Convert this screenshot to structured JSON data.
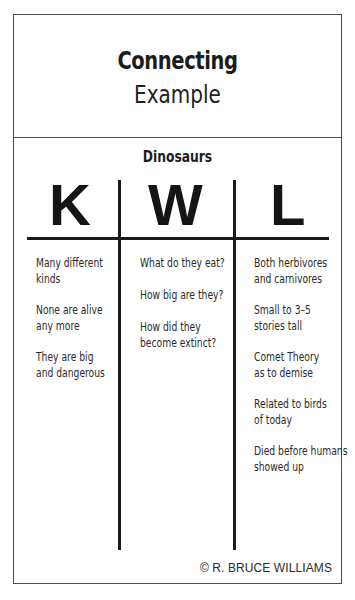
{
  "title": {
    "line1": "Connecting",
    "line2": "Example"
  },
  "topic": "Dinosaurs",
  "columns": [
    {
      "letter": "K",
      "items": [
        "Many different\nkinds",
        "None are alive\nany more",
        "They are big\nand dangerous"
      ]
    },
    {
      "letter": "W",
      "items": [
        "What do they eat?",
        "How big are they?",
        "How did they\nbecome extinct?"
      ]
    },
    {
      "letter": "L",
      "items": [
        "Both herbivores\nand carnivores",
        "Small to 3–5\nstories tall",
        "Comet Theory\nas to demise",
        "Related to birds\nof today",
        "Died before humans\nshowed up"
      ]
    }
  ],
  "copyright": "© R. BRUCE WILLIAMS",
  "colors": {
    "frame": "#4a4a4a",
    "rules": "#1a1a1a",
    "text": "#1e1e1e",
    "background": "#ffffff"
  }
}
